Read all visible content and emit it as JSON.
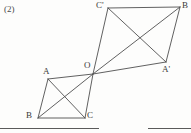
{
  "figure": {
    "item_number": "(2)",
    "canvas": {
      "width": 191,
      "height": 133
    },
    "stroke_color": "#4f4f4f",
    "background_color": "#fdfdfc",
    "vertices": [
      {
        "id": "Cp",
        "label": "C'",
        "x": 108,
        "y": 8
      },
      {
        "id": "B2",
        "label": "B",
        "x": 180,
        "y": 7
      },
      {
        "id": "Ap",
        "label": "A'",
        "x": 166,
        "y": 62
      },
      {
        "id": "O",
        "label": "O",
        "x": 93,
        "y": 74
      },
      {
        "id": "A",
        "label": "A",
        "x": 48,
        "y": 79
      },
      {
        "id": "B1",
        "label": "B",
        "x": 38,
        "y": 118
      },
      {
        "id": "C",
        "label": "C",
        "x": 85,
        "y": 118
      }
    ],
    "upper_quadrilateral": {
      "name": "quadrilateral-O-Cprime-B-Aprime",
      "sides": "O,Cp,B2,Ap",
      "diagonals": [
        [
          "O",
          "B2"
        ],
        [
          "Cp",
          "Ap"
        ]
      ]
    },
    "lower_quadrilateral": {
      "name": "quadrilateral-A-O-C-B",
      "sides": "A,O,C,B1",
      "diagonals": [
        [
          "A",
          "C"
        ],
        [
          "B1",
          "O"
        ]
      ]
    }
  },
  "footer": {
    "rule_left": {
      "x": 0,
      "y": 128,
      "width": 99
    },
    "rule_right": {
      "x": 148,
      "y": 128,
      "width": 43
    },
    "cut_text": ""
  }
}
